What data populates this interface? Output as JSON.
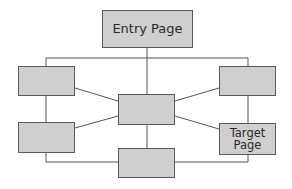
{
  "diagram": {
    "type": "site-navigation-network",
    "colors": {
      "node_fill": "#cfcfcf",
      "node_border": "#5a5a5a",
      "line": "#555555",
      "background": "#ffffff"
    },
    "nodes": [
      {
        "id": "entry",
        "label": "Entry Page"
      },
      {
        "id": "left-top",
        "label": ""
      },
      {
        "id": "right-top",
        "label": ""
      },
      {
        "id": "center",
        "label": ""
      },
      {
        "id": "left-bottom",
        "label": ""
      },
      {
        "id": "target",
        "label": "Target\nPage"
      },
      {
        "id": "bottom-center",
        "label": ""
      }
    ],
    "edges": [
      [
        "entry",
        "center"
      ],
      [
        "entry",
        "left-top"
      ],
      [
        "entry",
        "right-top"
      ],
      [
        "left-top",
        "center"
      ],
      [
        "right-top",
        "center"
      ],
      [
        "left-top",
        "left-bottom"
      ],
      [
        "right-top",
        "target"
      ],
      [
        "left-bottom",
        "center"
      ],
      [
        "target",
        "center"
      ],
      [
        "center",
        "bottom-center"
      ],
      [
        "left-bottom",
        "bottom-center"
      ],
      [
        "target",
        "bottom-center"
      ]
    ]
  }
}
